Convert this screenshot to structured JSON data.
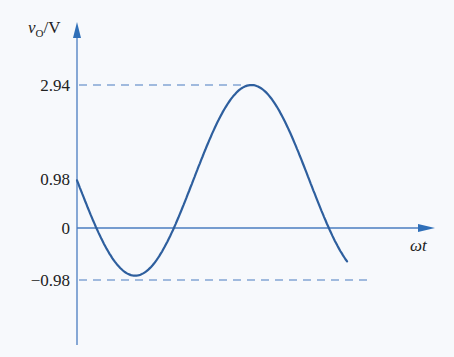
{
  "chart_data": {
    "type": "line",
    "title": "",
    "xlabel": "ωt",
    "ylabel": "vO/V",
    "ylabel_parts": {
      "var": "v",
      "sub": "O",
      "unit": "/V"
    },
    "yticks": [
      "2.94",
      "0.98",
      "0",
      "-0.98"
    ],
    "ytick_values": [
      2.94,
      0.98,
      0,
      -0.98
    ],
    "reference_lines": [
      {
        "y": 2.94,
        "style": "dashed"
      },
      {
        "y": -0.98,
        "style": "dashed"
      }
    ],
    "series": [
      {
        "name": "vO",
        "description": "sinusoid with DC offset 0.98 V and amplitude 1.96 V, starting at 0.98 V and decreasing",
        "x": [
          0,
          0.5,
          1.0,
          1.57,
          2.0,
          2.5,
          3.14,
          3.5,
          4.0,
          4.71,
          5.0,
          5.5,
          6.28,
          6.8,
          7.3
        ],
        "values": [
          0.98,
          0.04,
          -0.67,
          -0.98,
          -0.8,
          -0.19,
          0.98,
          1.65,
          2.46,
          2.94,
          2.86,
          2.33,
          0.98,
          -0.24,
          -0.7
        ]
      }
    ],
    "ylim": [
      -2.0,
      3.5
    ],
    "grid": false,
    "legend": "none",
    "color": "#2e5f9e"
  },
  "axes": {
    "y_label_var": "v",
    "y_label_sub": "O",
    "y_label_unit": "/V",
    "x_label": "ωt",
    "tick_294": "2.94",
    "tick_098": "0.98",
    "tick_0": "0",
    "tick_m098": "−0.98"
  }
}
